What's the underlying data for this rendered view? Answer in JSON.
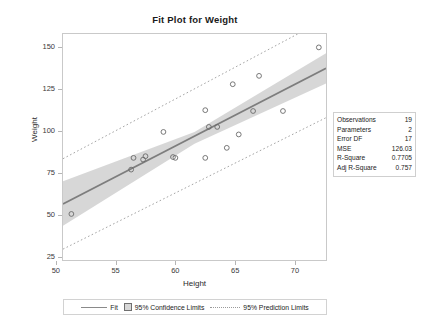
{
  "chart_data": {
    "type": "scatter",
    "title": "Fit Plot for Weight",
    "xlabel": "Height",
    "ylabel": "Weight",
    "xlim": [
      50.6,
      72.6
    ],
    "ylim": [
      23,
      158
    ],
    "xticks": [
      50,
      55,
      60,
      65,
      70
    ],
    "yticks": [
      25,
      50,
      75,
      100,
      125,
      150
    ],
    "grid": false,
    "legend_position": "bottom",
    "points": [
      {
        "x": 51.3,
        "y": 50.5
      },
      {
        "x": 56.3,
        "y": 77.0
      },
      {
        "x": 56.5,
        "y": 84.0
      },
      {
        "x": 57.3,
        "y": 83.0
      },
      {
        "x": 57.5,
        "y": 85.0
      },
      {
        "x": 59.0,
        "y": 99.5
      },
      {
        "x": 59.8,
        "y": 84.5
      },
      {
        "x": 62.5,
        "y": 112.5
      },
      {
        "x": 62.5,
        "y": 84.0
      },
      {
        "x": 62.8,
        "y": 102.5
      },
      {
        "x": 63.5,
        "y": 102.5
      },
      {
        "x": 64.3,
        "y": 90.0
      },
      {
        "x": 64.8,
        "y": 128.0
      },
      {
        "x": 65.3,
        "y": 98.0
      },
      {
        "x": 66.5,
        "y": 112.0
      },
      {
        "x": 67.0,
        "y": 133.0
      },
      {
        "x": 69.0,
        "y": 112.0
      },
      {
        "x": 72.0,
        "y": 150.0
      },
      {
        "x": 60.0,
        "y": 84.0
      }
    ],
    "fit_line": {
      "x1": 50.6,
      "y1": 56.5,
      "x2": 72.6,
      "y2": 137.5
    },
    "confidence_band": {
      "label": "95% Confidence Limits",
      "upper": [
        {
          "x": 50.6,
          "y": 70.0
        },
        {
          "x": 61.6,
          "y": 99.5
        },
        {
          "x": 72.6,
          "y": 146.5
        }
      ],
      "lower": [
        {
          "x": 50.6,
          "y": 43.5
        },
        {
          "x": 61.6,
          "y": 92.5
        },
        {
          "x": 72.6,
          "y": 128.5
        }
      ]
    },
    "prediction_band": {
      "label": "95% Prediction Limits",
      "upper": [
        {
          "x": 50.6,
          "y": 83.5
        },
        {
          "x": 72.6,
          "y": 167.0
        }
      ],
      "lower": [
        {
          "x": 50.6,
          "y": 29.5
        },
        {
          "x": 72.6,
          "y": 108.0
        }
      ]
    }
  },
  "statistics": {
    "rows": [
      {
        "label": "Observations",
        "value": "19"
      },
      {
        "label": "Parameters",
        "value": "2"
      },
      {
        "label": "Error DF",
        "value": "17"
      },
      {
        "label": "MSE",
        "value": "126.03"
      },
      {
        "label": "R-Square",
        "value": "0.7705"
      },
      {
        "label": "Adj R-Square",
        "value": "0.757"
      }
    ]
  },
  "legend": {
    "fit_label": "Fit",
    "confidence_label": "95% Confidence Limits",
    "prediction_label": "95% Prediction Limits"
  },
  "colors": {
    "fit_line": "#7d7d7d",
    "band_fill": "#d5d5d5",
    "prediction_line": "#a5a5a5",
    "marker": "#6a6a6a",
    "frame": "#c9c9c9"
  }
}
